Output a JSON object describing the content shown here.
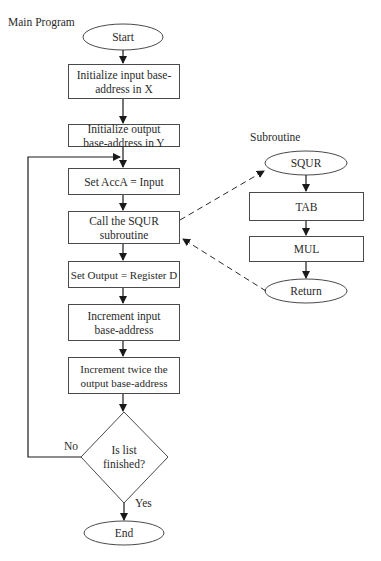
{
  "titles": {
    "main": "Main Program",
    "sub": "Subroutine"
  },
  "main_flow": {
    "start": "Start",
    "steps": [
      "Initialize input base-address in X",
      "Initialize output base-address in Y",
      "Set AccA = Input",
      "Call the SQUR subroutine",
      "Set Output = Register D",
      "Increment input base-address",
      "Increment twice the output base-address"
    ],
    "decision": "Is list finished?",
    "decision_no": "No",
    "decision_yes": "Yes",
    "end": "End"
  },
  "subroutine": {
    "entry": "SQUR",
    "steps": [
      "TAB",
      "MUL"
    ],
    "exit": "Return"
  },
  "colors": {
    "line": "#2a2a2a",
    "border": "#4a4a4a"
  }
}
